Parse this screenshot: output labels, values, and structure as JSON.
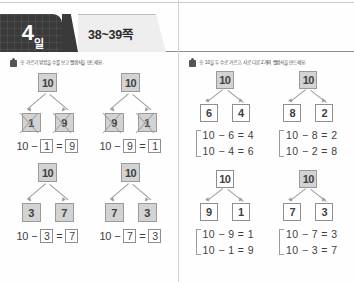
{
  "header": {
    "day_number": "4",
    "day_unit": "일",
    "page_range": "38~39쪽"
  },
  "left_panel": {
    "instruction_text": "※ 가르기 방법을 수를 보고 뺄셈식을 만드세요.",
    "items": [
      {
        "top": "10",
        "left_child": "1",
        "right_child": "9",
        "equation": {
          "minuend": "10",
          "op": "−",
          "subtrahend": "1",
          "eq": "=",
          "result": "9"
        },
        "crossed_out": true
      },
      {
        "top": "10",
        "left_child": "9",
        "right_child": "1",
        "equation": {
          "minuend": "10",
          "op": "−",
          "subtrahend": "9",
          "eq": "=",
          "result": "1"
        },
        "crossed_out": true
      },
      {
        "top": "10",
        "left_child": "3",
        "right_child": "7",
        "equation": {
          "minuend": "10",
          "op": "−",
          "subtrahend": "3",
          "eq": "=",
          "result": "7"
        },
        "crossed_out": false
      },
      {
        "top": "10",
        "left_child": "7",
        "right_child": "3",
        "equation": {
          "minuend": "10",
          "op": "−",
          "subtrahend": "7",
          "eq": "=",
          "result": "3"
        },
        "crossed_out": false
      }
    ]
  },
  "right_panel": {
    "instruction_text": "※ 10을 두 수로 가르고, 서로 다른 2개의 뺄셈식을 만드세요.",
    "groups": [
      {
        "top": "10",
        "left_child": "6",
        "right_child": "4",
        "equations": [
          "10 − 6 = 4",
          "10 − 4 = 6"
        ]
      },
      {
        "top": "10",
        "left_child": "8",
        "right_child": "2",
        "equations": [
          "10 − 8 = 2",
          "10 − 2 = 8"
        ]
      },
      {
        "top": "10",
        "left_child": "9",
        "right_child": "1",
        "equations": [
          "10 − 9 = 1",
          "10 − 1 = 9"
        ]
      },
      {
        "top": "10",
        "left_child": "7",
        "right_child": "3",
        "equations": [
          "10 − 7 = 3",
          "10 − 3 = 7"
        ]
      }
    ]
  },
  "colors": {
    "tab_dark": "#3a3a3a",
    "tab_light": "#eeeeee",
    "node_shaded": "#d3d3d3",
    "rule": "#8d8d8d"
  }
}
